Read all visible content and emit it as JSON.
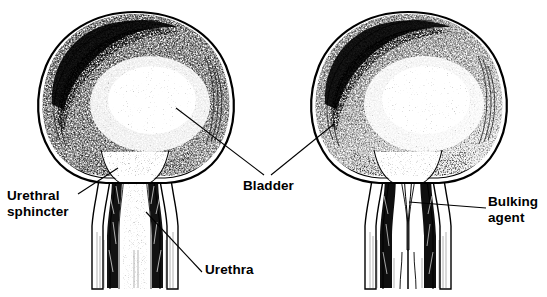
{
  "figure": {
    "background_color": "#ffffff",
    "ink_color": "#000000",
    "width": 547,
    "height": 297,
    "style": "black-and-white stippled medical line illustration",
    "panels": [
      {
        "id": "left-panel",
        "name": "normal-bladder",
        "description": "Bladder with open urethra and urethral sphincter"
      },
      {
        "id": "right-panel",
        "name": "bladder-with-bulking-agent",
        "description": "Bladder with urethra coapted closed by bulking agent deposits"
      }
    ]
  },
  "labels": {
    "urethral_sphincter": {
      "line1": "Urethral",
      "line2": "sphincter"
    },
    "bladder": {
      "text": "Bladder"
    },
    "urethra": {
      "text": "Urethra"
    },
    "bulking_agent": {
      "line1": "Bulking",
      "line2": "agent"
    }
  },
  "leader_lines": [
    {
      "name": "urethral-sphincter-leader",
      "from": [
        78,
        194
      ],
      "to": [
        118,
        168
      ]
    },
    {
      "name": "bladder-leader-left",
      "from": [
        264,
        175
      ],
      "to": [
        176,
        108
      ]
    },
    {
      "name": "bladder-leader-right",
      "from": [
        271,
        175
      ],
      "to": [
        334,
        124
      ]
    },
    {
      "name": "urethra-leader",
      "from": [
        202,
        272
      ],
      "to": [
        146,
        212
      ]
    },
    {
      "name": "bulking-agent-leader",
      "from": [
        486,
        208
      ],
      "to": [
        409,
        202
      ]
    }
  ]
}
